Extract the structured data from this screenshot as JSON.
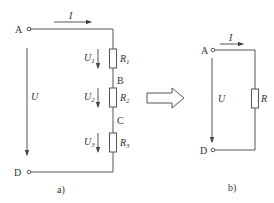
{
  "diagram": {
    "type": "series circuit equivalence",
    "colors": {
      "line": "#555555",
      "text": "#333333",
      "background": "#ffffff"
    },
    "panel_a": {
      "caption": "a)",
      "terminals": {
        "top": "A",
        "bottom": "D"
      },
      "nodes": [
        "B",
        "C"
      ],
      "current_label": "I",
      "voltage_label": "U",
      "resistors": [
        {
          "name": "R",
          "sub": "1",
          "voltage": "U",
          "vsub": "1"
        },
        {
          "name": "R",
          "sub": "2",
          "voltage": "U",
          "vsub": "2"
        },
        {
          "name": "R",
          "sub": "3",
          "voltage": "U",
          "vsub": "3"
        }
      ]
    },
    "transform_arrow": "hollow-right-arrow",
    "panel_b": {
      "caption": "b)",
      "terminals": {
        "top": "A",
        "bottom": "D"
      },
      "current_label": "I",
      "voltage_label": "U",
      "resistor": "R"
    }
  }
}
